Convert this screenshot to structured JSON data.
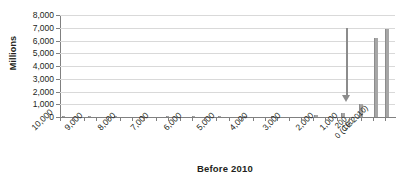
{
  "chart_data": {
    "type": "bar",
    "title": "Before 2010",
    "xlabel": "Before 2010",
    "ylabel": "Millions",
    "ylim": [
      0,
      8000
    ],
    "ytick_values": [
      0,
      1000,
      2000,
      3000,
      4000,
      5000,
      6000,
      7000,
      8000
    ],
    "ytick_labels": [
      "0",
      "1,000",
      "2,000",
      "3,000",
      "4,000",
      "5,000",
      "6,000",
      "7,000",
      "8,000"
    ],
    "xtick_labels": [
      "10,000",
      "9,000",
      "8,000",
      "7,000",
      "6,000",
      "5,000",
      "4,000",
      "3,000",
      "2,000",
      "1,000",
      "200",
      "100",
      "0 (CE 2010)"
    ],
    "grid": true,
    "legend": false,
    "axis_direction": "reversed",
    "categories": [
      "10,000",
      "9,000",
      "8,000",
      "7,000",
      "6,000",
      "5,000",
      "4,000",
      "3,000",
      "2,000",
      "1,000",
      "200",
      "100",
      "0 (CE 2010)"
    ],
    "values": [
      1,
      1,
      1,
      1,
      1,
      5,
      10,
      20,
      50,
      170,
      990,
      6200,
      6900
    ],
    "bars": [
      {
        "label": "10,000",
        "value": 1,
        "x": 2
      },
      {
        "label": "9,000",
        "value": 1,
        "x": 28
      },
      {
        "label": "8,000",
        "value": 1,
        "x": 54
      },
      {
        "label": "7,000",
        "value": 1,
        "x": 80
      },
      {
        "label": "6,000",
        "value": 1,
        "x": 106
      },
      {
        "label": "5,000",
        "value": 5,
        "x": 132
      },
      {
        "label": "4,000",
        "value": 10,
        "x": 158
      },
      {
        "label": "3,000",
        "value": 20,
        "x": 184
      },
      {
        "label": "2,000",
        "value": 60,
        "x": 211
      },
      {
        "label": "1,000",
        "value": 170,
        "x": 254
      },
      {
        "label": "200",
        "value": 300,
        "x": 281
      },
      {
        "label": "100",
        "value": 990,
        "x": 299
      },
      {
        "label": "0 (CE 2010)",
        "value": 6200,
        "x": 314
      },
      {
        "label": "0 (CE 2010)",
        "value": 6900,
        "x": 325
      }
    ],
    "annotation": {
      "type": "down-arrow",
      "from_value": 7100,
      "to_value": 1200,
      "at_category": "1,000"
    },
    "colors": {
      "bar": "#a6a6a6",
      "arrow": "#8c8c8c",
      "gridline": "#d9d9d9",
      "axis": "#808080",
      "text": "#231f20"
    }
  }
}
